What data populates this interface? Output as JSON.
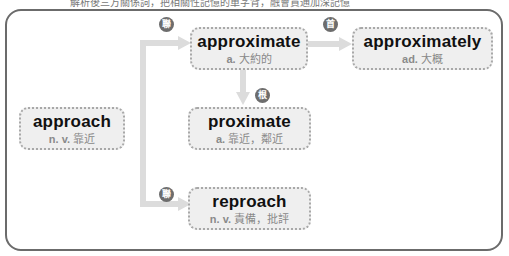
{
  "caption": "解析後三方關係詞，把相關性記憶的單字背，融會貫通加深記憶",
  "nodes": {
    "approach": {
      "word": "approach",
      "pos": "n. v.",
      "meaning": "靠近"
    },
    "approximate": {
      "word": "approximate",
      "pos": "a.",
      "meaning": "大約的"
    },
    "approximately": {
      "word": "approximately",
      "pos": "ad.",
      "meaning": "大概"
    },
    "proximate": {
      "word": "proximate",
      "pos": "a.",
      "meaning": "靠近，鄰近"
    },
    "reproach": {
      "word": "reproach",
      "pos": "n. v.",
      "meaning": "責備，批評"
    }
  },
  "badges": {
    "related_top": "聯",
    "related_bottom": "聯",
    "head": "首",
    "root": "根"
  },
  "colors": {
    "frame": "#6b6b6b",
    "box_fill": "#efefef",
    "box_border": "#a8a8a8",
    "connector": "#dcdcdc",
    "badge": "#6d6d6d"
  }
}
